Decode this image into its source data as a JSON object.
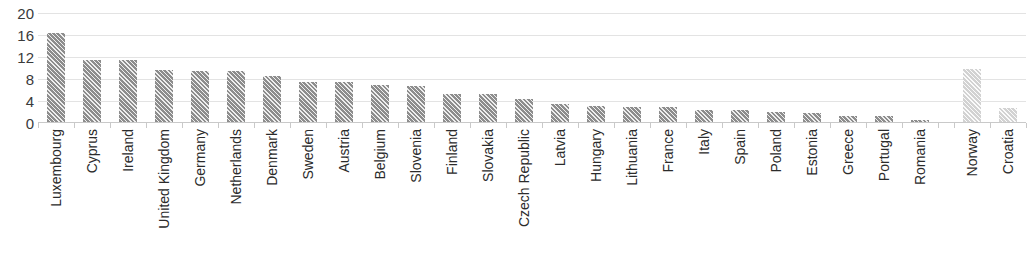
{
  "chart_data": {
    "type": "bar",
    "title": "",
    "subtitle": "",
    "xlabel": "",
    "ylabel": "",
    "ylim": [
      0,
      20
    ],
    "ytick_values": [
      20,
      16,
      12,
      8,
      4,
      0
    ],
    "ytick_labels": [
      "20",
      "16",
      "12",
      "8",
      "4",
      "0"
    ],
    "grid": true,
    "legend": "none",
    "legend_entries": [],
    "annotations": [],
    "categories": [
      "Luxembourg",
      "Cyprus",
      "Ireland",
      "United Kingdom",
      "Germany",
      "Netherlands",
      "Denmark",
      "Sweden",
      "Austria",
      "Belgium",
      "Slovenia",
      "Finland",
      "Slovakia",
      "Czech Republic",
      "Latvia",
      "Hungary",
      "Lithuania",
      "France",
      "Italy",
      "Spain",
      "Poland",
      "Estonia",
      "Greece",
      "Portugal",
      "Romania",
      "Norway",
      "Croatia"
    ],
    "values": [
      16.3,
      11.4,
      11.4,
      9.6,
      9.5,
      9.5,
      8.6,
      7.5,
      7.4,
      7.0,
      6.7,
      5.3,
      5.2,
      4.3,
      3.4,
      3.1,
      3.0,
      2.9,
      2.4,
      2.3,
      2.0,
      1.9,
      1.3,
      1.2,
      0.6,
      9.8,
      2.7
    ],
    "bar_styles": [
      "dark",
      "dark",
      "dark",
      "dark",
      "dark",
      "dark",
      "dark",
      "dark",
      "dark",
      "dark",
      "dark",
      "dark",
      "dark",
      "dark",
      "dark",
      "dark",
      "dark",
      "dark",
      "dark",
      "dark",
      "dark",
      "dark",
      "dark",
      "dark",
      "dark",
      "light",
      "light"
    ],
    "gap_after_index": 24,
    "colors": {
      "bar_dark": "#8d8d8d",
      "bar_light": "#d2d2d2",
      "gridline": "#e3e3e3",
      "axis": "#c9c9c9",
      "tick_text": "#3a3a3a",
      "category_text": "#2b2b2b",
      "background": "#ffffff"
    }
  }
}
